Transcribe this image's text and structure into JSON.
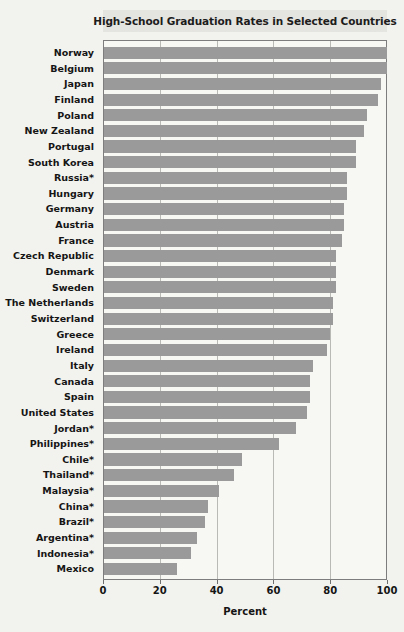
{
  "chart_data": {
    "type": "bar",
    "orientation": "horizontal",
    "title": "High-School Graduation Rates in Selected Countries",
    "xlabel": "Percent",
    "ylabel": "",
    "xlim": [
      0,
      100
    ],
    "xticks": [
      0,
      20,
      40,
      60,
      80,
      100
    ],
    "grid": true,
    "legend": false,
    "bar_color": "#9a9a9a",
    "background_color": "#f2f2ee",
    "plot_background_color": "#f7f7f4",
    "title_band_color": "#e4e4e0",
    "axis_color": "#7d7d7d",
    "note": "* indicates estimated rate",
    "categories": [
      "Norway",
      "Belgium",
      "Japan",
      "Finland",
      "Poland",
      "New Zealand",
      "Portugal",
      "South Korea",
      "Russia*",
      "Hungary",
      "Germany",
      "Austria",
      "France",
      "Czech Republic",
      "Denmark",
      "Sweden",
      "The Netherlands",
      "Switzerland",
      "Greece",
      "Ireland",
      "Italy",
      "Canada",
      "Spain",
      "United States",
      "Jordan*",
      "Philippines*",
      "Chile*",
      "Thailand*",
      "Malaysia*",
      "China*",
      "Brazil*",
      "Argentina*",
      "Indonesia*",
      "Mexico"
    ],
    "values": [
      100,
      100,
      98,
      97,
      93,
      92,
      89,
      89,
      86,
      86,
      85,
      85,
      84,
      82,
      82,
      82,
      81,
      81,
      80,
      79,
      74,
      73,
      73,
      72,
      68,
      62,
      49,
      46,
      41,
      37,
      36,
      33,
      31,
      26
    ]
  }
}
